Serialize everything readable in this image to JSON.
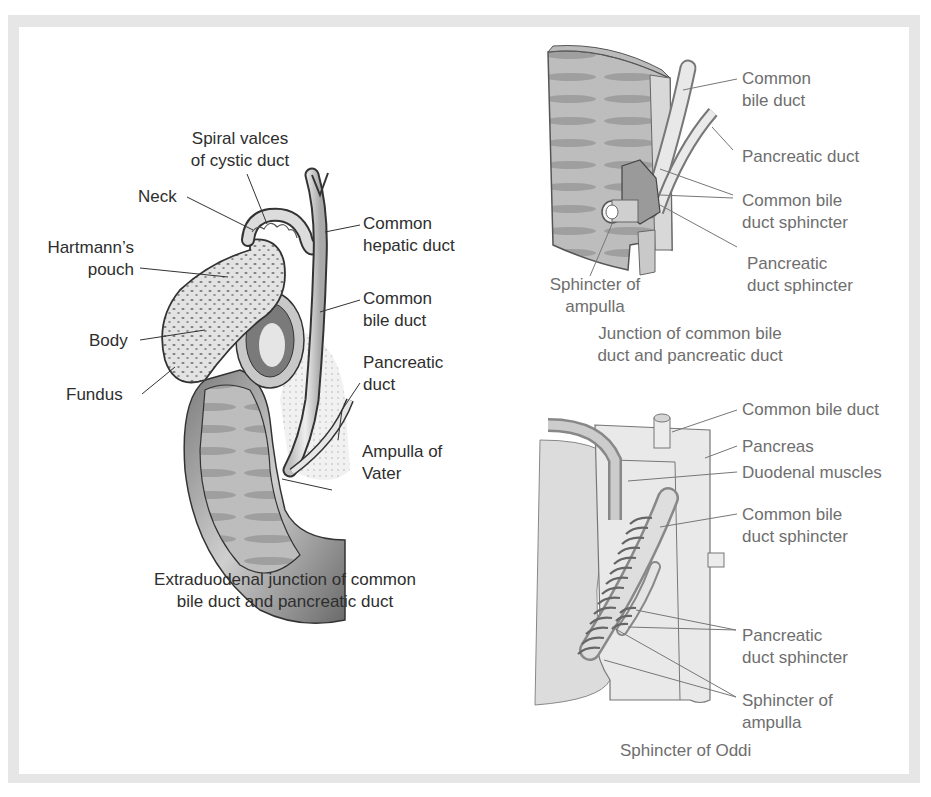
{
  "colors": {
    "frame": "#e6e6e6",
    "left_text": "#2e2e2e",
    "right_text": "#6e6e6e",
    "tissue_dark": "#5a5a5a",
    "tissue_light": "#d9d9d9"
  },
  "figure_left": {
    "caption_line1": "Extraduodenal junction of common",
    "caption_line2": "bile duct and pancreatic duct",
    "labels": {
      "spiral_1": "Spiral valces",
      "spiral_2": "of cystic duct",
      "neck": "Neck",
      "hartmann_1": "Hartmann’s",
      "hartmann_2": "pouch",
      "body": "Body",
      "fundus": "Fundus",
      "chd_1": "Common",
      "chd_2": "hepatic duct",
      "cbd_1": "Common",
      "cbd_2": "bile duct",
      "pd_1": "Pancreatic",
      "pd_2": "duct",
      "av_1": "Ampulla of",
      "av_2": "Vater"
    }
  },
  "figure_top_right": {
    "caption_line1": "Junction of common bile",
    "caption_line2": "duct and pancreatic duct",
    "labels": {
      "cbd_1": "Common",
      "cbd_2": "bile duct",
      "pd": "Pancreatic duct",
      "cbds_1": "Common bile",
      "cbds_2": "duct sphincter",
      "pds_1": "Pancreatic",
      "pds_2": "duct sphincter",
      "soa_1": "Sphincter of",
      "soa_2": "ampulla"
    }
  },
  "figure_bottom_right": {
    "caption": "Sphincter of Oddi",
    "labels": {
      "cbd": "Common bile duct",
      "pancreas": "Pancreas",
      "duodenal": "Duodenal muscles",
      "cbds_1": "Common bile",
      "cbds_2": "duct sphincter",
      "pds_1": "Pancreatic",
      "pds_2": "duct sphincter",
      "soa_1": "Sphincter of",
      "soa_2": "ampulla"
    }
  }
}
